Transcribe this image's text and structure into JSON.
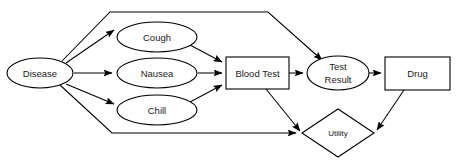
{
  "diagram": {
    "background_color": "#ffffff",
    "stroke_color": "#000000",
    "text_color": "#1a1a1a",
    "nodes": {
      "disease": {
        "label": "Disease",
        "type": "chance",
        "shape": "ellipse",
        "cx": 40,
        "cy": 73,
        "rx": 33,
        "ry": 15
      },
      "cough": {
        "label": "Cough",
        "type": "chance",
        "shape": "ellipse",
        "cx": 157,
        "cy": 37,
        "rx": 40,
        "ry": 15
      },
      "nausea": {
        "label": "Nausea",
        "type": "chance",
        "shape": "ellipse",
        "cx": 157,
        "cy": 73,
        "rx": 40,
        "ry": 15
      },
      "chill": {
        "label": "Chill",
        "type": "chance",
        "shape": "ellipse",
        "cx": 157,
        "cy": 110,
        "rx": 40,
        "ry": 15
      },
      "blood_test": {
        "label": "Blood Test",
        "type": "decision",
        "shape": "rect",
        "x": 226,
        "y": 57,
        "width": 63,
        "height": 32
      },
      "test_result": {
        "label": "Test Result",
        "label_line_1": "Test",
        "label_line_2": "Result",
        "type": "chance",
        "shape": "ellipse",
        "cx": 338,
        "cy": 73,
        "rx": 31,
        "ry": 17
      },
      "drug": {
        "label": "Drug",
        "type": "decision",
        "shape": "rect",
        "x": 385,
        "y": 57,
        "width": 65,
        "height": 33
      },
      "utility": {
        "label": "Utility",
        "type": "utility",
        "shape": "diamond",
        "cx": 338,
        "cy": 133,
        "rx": 36,
        "ry": 24
      }
    },
    "edges": [
      {
        "name": "disease-to-cough",
        "from": "disease",
        "to": "cough",
        "arrow": true
      },
      {
        "name": "disease-to-nausea",
        "from": "disease",
        "to": "nausea",
        "arrow": true
      },
      {
        "name": "disease-to-chill",
        "from": "disease",
        "to": "chill",
        "arrow": true
      },
      {
        "name": "disease-to-test-result",
        "from": "disease",
        "to": "test_result",
        "arrow": true,
        "style": "polyline-top"
      },
      {
        "name": "disease-to-utility",
        "from": "disease",
        "to": "utility",
        "arrow": true,
        "style": "polyline-bottom"
      },
      {
        "name": "cough-to-blood-test",
        "from": "cough",
        "to": "blood_test",
        "arrow": true
      },
      {
        "name": "nausea-to-blood-test",
        "from": "nausea",
        "to": "blood_test",
        "arrow": true
      },
      {
        "name": "chill-to-blood-test",
        "from": "chill",
        "to": "blood_test",
        "arrow": true
      },
      {
        "name": "blood-test-to-test-result",
        "from": "blood_test",
        "to": "test_result",
        "arrow": true
      },
      {
        "name": "blood-test-to-utility",
        "from": "blood_test",
        "to": "utility",
        "arrow": true
      },
      {
        "name": "test-result-to-drug",
        "from": "test_result",
        "to": "drug",
        "arrow": true
      },
      {
        "name": "drug-to-utility",
        "from": "drug",
        "to": "utility",
        "arrow": true
      }
    ]
  }
}
